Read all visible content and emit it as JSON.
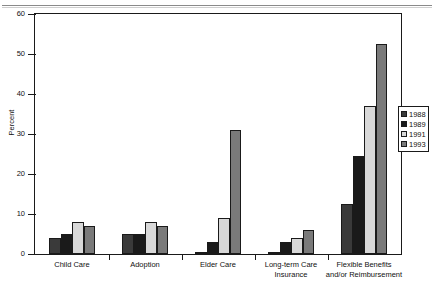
{
  "chart_data": {
    "type": "bar",
    "title": "",
    "xlabel": "",
    "ylabel": "Percent",
    "ylim": [
      0,
      60
    ],
    "yticks": [
      0,
      10,
      20,
      30,
      40,
      50,
      60
    ],
    "ytick_labels": [
      "0",
      "10",
      "20",
      "30",
      "40",
      "50",
      "60"
    ],
    "grid": false,
    "legend_position": "right",
    "categories": [
      "Child Care",
      "Adoption",
      "Elder Care",
      "Long-term Care Insurance",
      "Flexible Benefits and/or Reimbursement"
    ],
    "category_label_lines": [
      [
        "Child Care"
      ],
      [
        "Adoption"
      ],
      [
        "Elder Care"
      ],
      [
        "Long-term Care",
        "Insurance"
      ],
      [
        "Flexible Benefits",
        "and/or Reimbursement"
      ]
    ],
    "series": [
      {
        "name": "1988",
        "color": "#3a3a3a",
        "values": [
          4,
          5,
          0.3,
          0.3,
          12.5
        ]
      },
      {
        "name": "1989",
        "color": "#1a1a1a",
        "values": [
          5,
          5,
          3,
          3,
          24.5
        ]
      },
      {
        "name": "1991",
        "color": "#d8d8d8",
        "values": [
          8,
          8,
          9,
          4,
          37
        ]
      },
      {
        "name": "1993",
        "color": "#7a7a7a",
        "values": [
          7,
          7,
          31,
          6,
          52.5
        ]
      }
    ]
  },
  "legend": {
    "items": [
      {
        "label": "1988",
        "color": "#3a3a3a"
      },
      {
        "label": "1989",
        "color": "#1a1a1a"
      },
      {
        "label": "1991",
        "color": "#d8d8d8"
      },
      {
        "label": "1993",
        "color": "#7a7a7a"
      }
    ]
  },
  "colors": {
    "axis": "#1a1a1a",
    "background": "#ffffff",
    "bar_1988": "#3a3a3a",
    "bar_1989": "#1a1a1a",
    "bar_1991": "#d8d8d8",
    "bar_1993": "#7a7a7a"
  }
}
